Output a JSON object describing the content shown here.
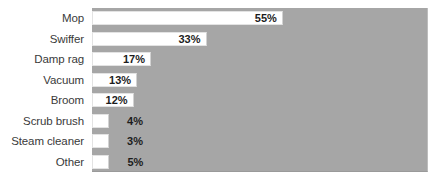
{
  "chart_data": {
    "type": "bar",
    "orientation": "horizontal",
    "title": "",
    "xlabel": "",
    "ylabel": "",
    "grid": false,
    "legend": null,
    "xlim": [
      0,
      100
    ],
    "value_suffix": "%",
    "categories": [
      "Mop",
      "Swiffer",
      "Damp rag",
      "Vacuum",
      "Broom",
      "Scrub brush",
      "Steam cleaner",
      "Other"
    ],
    "values": [
      55,
      33,
      17,
      13,
      12,
      4,
      3,
      5
    ],
    "labels": [
      "55%",
      "33%",
      "17%",
      "13%",
      "12%",
      "4%",
      "3%",
      "5%"
    ],
    "label_placement": [
      "inside-end",
      "inside-end",
      "inside-end",
      "inside-end",
      "inside-end",
      "outside-end",
      "outside-end",
      "outside-end"
    ]
  },
  "style": {
    "plot_background": "#a6a6a6",
    "bar_fill": "#ffffff",
    "bar_border": "#e3e3e3",
    "label_color": "#3a3a3a",
    "value_color": "#1c1c1c",
    "page_background": "#ffffff"
  }
}
